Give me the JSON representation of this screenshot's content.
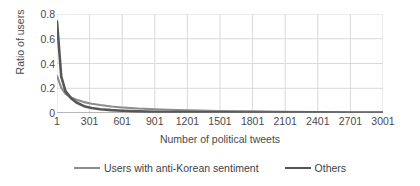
{
  "chart_data": {
    "type": "line",
    "title": "",
    "xlabel": "Number of political tweets",
    "ylabel": "Ratio of users",
    "xlim": [
      1,
      3001
    ],
    "ylim": [
      0,
      0.8
    ],
    "grid": true,
    "legend_position": "bottom",
    "xticks": [
      "1",
      "301",
      "601",
      "901",
      "1201",
      "1501",
      "1801",
      "2101",
      "2401",
      "2701",
      "3001"
    ],
    "xtick_values": [
      1,
      301,
      601,
      901,
      1201,
      1501,
      1801,
      2101,
      2401,
      2701,
      3001
    ],
    "yticks": [
      "0.8",
      "0.6",
      "0.4",
      "0.2",
      "0"
    ],
    "ytick_values": [
      0.8,
      0.6,
      0.4,
      0.2,
      0
    ],
    "x": [
      1,
      40,
      80,
      130,
      180,
      250,
      320,
      400,
      500,
      601,
      750,
      901,
      1100,
      1201,
      1400,
      1501,
      1800,
      2101,
      2401,
      2701,
      3001
    ],
    "series": [
      {
        "name": "Users with anti-Korean sentiment",
        "color": "#8c8c8c",
        "width": 2.1,
        "values": [
          0.3,
          0.205,
          0.155,
          0.125,
          0.107,
          0.088,
          0.075,
          0.064,
          0.053,
          0.045,
          0.036,
          0.03,
          0.024,
          0.021,
          0.018,
          0.016,
          0.013,
          0.01,
          0.008,
          0.006,
          0.005
        ]
      },
      {
        "name": "Others",
        "color": "#575757",
        "width": 2.6,
        "values": [
          0.74,
          0.295,
          0.175,
          0.12,
          0.085,
          0.055,
          0.04,
          0.03,
          0.023,
          0.018,
          0.013,
          0.01,
          0.008,
          0.007,
          0.006,
          0.005,
          0.004,
          0.003,
          0.003,
          0.002,
          0.002
        ]
      }
    ],
    "legend": [
      {
        "label": "Users with anti-Korean sentiment",
        "color": "#8c8c8c",
        "width": 2.1
      },
      {
        "label": "Others",
        "color": "#575757",
        "width": 2.8
      }
    ],
    "grid_color": "#d9d9d9",
    "axis_color": "#bfbfbf",
    "text_color": "#4a4a4a"
  }
}
